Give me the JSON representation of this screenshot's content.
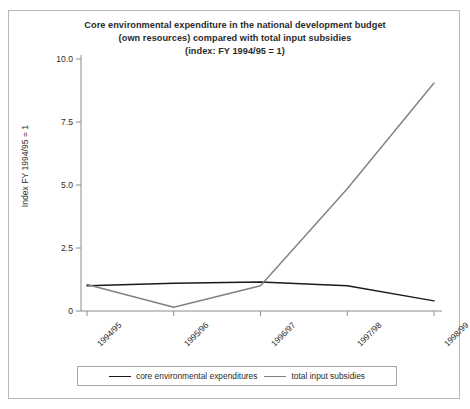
{
  "chart_data": {
    "type": "line",
    "title": "Core environmental expenditure in the national development budget (own resources) compared with total input subsidies (index: FY 1994/95 = 1)",
    "title_lines": [
      "Core environmental expenditure in the national development budget",
      "(own resources) compared with total input subsidies",
      "(index: FY 1994/95 = 1)"
    ],
    "xlabel": "",
    "ylabel": "Index FY 1994/95 = 1",
    "categories": [
      "1994/95",
      "1995/96",
      "1996/97",
      "1997/98",
      "1998/99"
    ],
    "ylim": [
      0,
      10
    ],
    "yticks": [
      0,
      2.5,
      5.0,
      7.5,
      10.0
    ],
    "ytick_labels": [
      "0",
      "2.5",
      "5.0",
      "7.5",
      "10.0"
    ],
    "grid": false,
    "legend_position": "bottom",
    "series": [
      {
        "name": "core environmental expenditures",
        "color": "#1a1a1a",
        "values": [
          1.0,
          1.1,
          1.15,
          1.0,
          0.4
        ]
      },
      {
        "name": "total input subsidies",
        "color": "#808080",
        "values": [
          1.05,
          0.15,
          1.0,
          4.85,
          9.05
        ]
      }
    ]
  },
  "axis": {
    "ylabel": "Index FY 1994/95 = 1"
  }
}
